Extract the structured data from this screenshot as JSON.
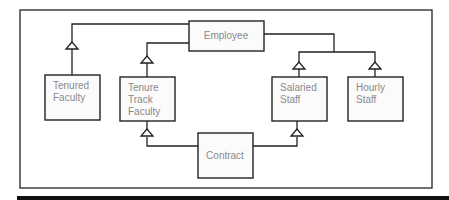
{
  "diagram": {
    "type": "uml-class-inheritance",
    "classes": {
      "employee": {
        "lines": [
          "Employee"
        ]
      },
      "contract": {
        "lines": [
          "Contract"
        ]
      },
      "tenured_faculty": {
        "lines": [
          "Tenured",
          "Faculty"
        ]
      },
      "tenure_track_faculty": {
        "lines": [
          "Tenure",
          "Track",
          "Faculty"
        ]
      },
      "salaried_staff": {
        "lines": [
          "Salaried",
          "Staff"
        ]
      },
      "hourly_staff": {
        "lines": [
          "Hourly",
          "Staff"
        ]
      }
    },
    "relationships": [
      {
        "kind": "generalization",
        "child": "Employee",
        "parent": "Tenured Faculty"
      },
      {
        "kind": "generalization",
        "child": "Employee",
        "parent": "Tenure Track Faculty"
      },
      {
        "kind": "generalization",
        "child": "Employee",
        "parent": "Salaried Staff"
      },
      {
        "kind": "generalization",
        "child": "Employee",
        "parent": "Hourly Staff"
      },
      {
        "kind": "generalization",
        "child": "Contract",
        "parent": "Tenure Track Faculty"
      },
      {
        "kind": "generalization",
        "child": "Contract",
        "parent": "Salaried Staff"
      }
    ]
  }
}
